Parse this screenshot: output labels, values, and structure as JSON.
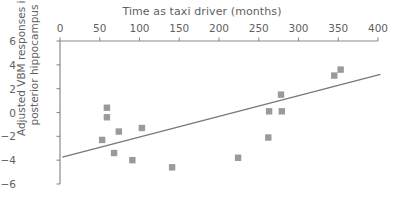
{
  "chart_data": {
    "type": "scatter",
    "title": "",
    "xlabel": "Time as taxi driver (months)",
    "ylabel": "Adjusted VBM responses in posterior hippocampus",
    "xlabel_line1": "Adjusted VBM responses in",
    "ylabel_line1": "Adjusted VBM responses in",
    "ylabel_line2": "posterior hippocampus",
    "xlim": [
      0,
      400
    ],
    "ylim": [
      -6,
      6
    ],
    "xticks": [
      0,
      50,
      100,
      150,
      200,
      250,
      300,
      350,
      400
    ],
    "xticklabels": [
      "0",
      "50",
      "100",
      "150",
      "200",
      "250",
      "300",
      "350",
      "400"
    ],
    "yticks": [
      6,
      4,
      2,
      0,
      -2,
      -4,
      -6
    ],
    "yticklabels": [
      "6",
      "4",
      "2",
      "0",
      "−2",
      "−4",
      "−6"
    ],
    "grid": false,
    "legend": false,
    "x_axis_position": "top",
    "marker_shape": "square",
    "marker_color": "#9a9a9a",
    "line_color": "#777777",
    "axis_color": "#8a8a8a",
    "points": [
      {
        "x": 53,
        "y": -2.3
      },
      {
        "x": 59,
        "y": 0.4
      },
      {
        "x": 59,
        "y": -0.4
      },
      {
        "x": 68,
        "y": -3.4
      },
      {
        "x": 74,
        "y": -1.6
      },
      {
        "x": 91,
        "y": -4.0
      },
      {
        "x": 103,
        "y": -1.3
      },
      {
        "x": 141,
        "y": -4.6
      },
      {
        "x": 224,
        "y": -3.8
      },
      {
        "x": 262,
        "y": -2.1
      },
      {
        "x": 263,
        "y": 0.1
      },
      {
        "x": 279,
        "y": 0.1
      },
      {
        "x": 278,
        "y": 1.5
      },
      {
        "x": 345,
        "y": 3.1
      },
      {
        "x": 353,
        "y": 3.6
      }
    ],
    "trendline": {
      "name": "linear fit",
      "x": [
        3,
        403
      ],
      "y": [
        -3.75,
        3.2
      ]
    }
  }
}
